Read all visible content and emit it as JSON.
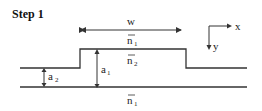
{
  "title": "Step 1",
  "labels": {
    "width": "w",
    "n_upper": "n",
    "n_upper_sub": "1",
    "n_core": "n",
    "n_core_sub": "2",
    "n_lower": "n",
    "n_lower_sub": "1",
    "a1": "a",
    "a1_sub": "1",
    "a2": "a",
    "a2_sub": "2",
    "axis_x": "x",
    "axis_y": "y"
  },
  "colors": {
    "line": "#333333",
    "background": "#ffffff"
  }
}
